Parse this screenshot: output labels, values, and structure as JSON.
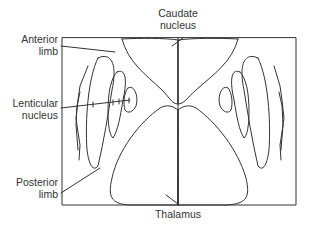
{
  "diagram": {
    "labels": {
      "caudate": {
        "line1": "Caudate",
        "line2": "nucleus"
      },
      "anterior_limb": {
        "line1": "Anterior",
        "line2": "limb"
      },
      "lenticular": {
        "line1": "Lenticular",
        "line2": "nucleus"
      },
      "posterior_limb": {
        "line1": "Posterior",
        "line2": "limb"
      },
      "thalamus": {
        "line1": "Thalamus"
      }
    },
    "stroke_color": "#333333",
    "background_color": "#ffffff"
  }
}
